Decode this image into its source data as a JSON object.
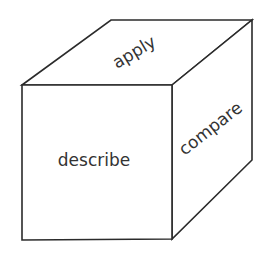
{
  "diagram": {
    "type": "cube",
    "colors": {
      "stroke": "#2b2b2b",
      "text": "#333333",
      "background": "#ffffff"
    },
    "faces": {
      "front": {
        "label": "describe"
      },
      "top": {
        "label": "apply"
      },
      "side": {
        "label": "compare"
      }
    }
  }
}
